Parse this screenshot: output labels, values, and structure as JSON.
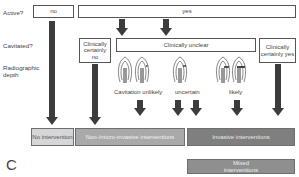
{
  "rows": {
    "active_label": "Active?",
    "cavitated_label": "Cavitated?",
    "radiographic_label_line1": "Radiographic",
    "radiographic_label_line2": "depth"
  },
  "active": {
    "no": "no",
    "yes": "yes"
  },
  "cavitated": {
    "certainly_no": "Clinically certainly no",
    "unclear": "Clinically unclear",
    "certainly_yes": "Clinically certainly yes"
  },
  "radiographic": {
    "cavitation_unlikely": "Cavitation unlikely",
    "uncertain": "uncertain",
    "likely": "likely"
  },
  "outcomes": {
    "no_intervention": "No intervention",
    "non_micro_invasive": "Non-/micro-invasive interventions",
    "invasive": "Invasive interventions",
    "mixed": "Mixed interventions"
  },
  "panel_letter": "C",
  "colors": {
    "arrow": "#3c3c3c",
    "no_intervention_fill": "#d6d6d6",
    "non_micro_invasive_fill": "#a9a9a9",
    "invasive_fill": "#7f7f7f",
    "mixed_fill": "#8f8f8f",
    "box_border": "#555555"
  }
}
